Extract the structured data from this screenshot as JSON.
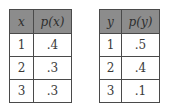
{
  "tables": [
    {
      "headers": [
        "x",
        "p(x)"
      ],
      "rows": [
        [
          "1",
          ".4"
        ],
        [
          "2",
          ".3"
        ],
        [
          "3",
          ".3"
        ]
      ]
    },
    {
      "headers": [
        "y",
        "p(y)"
      ],
      "rows": [
        [
          "1",
          ".5"
        ],
        [
          "2",
          ".4"
        ],
        [
          "3",
          ".1"
        ]
      ]
    }
  ],
  "colors": {
    "header_bg": "#8c8c8c",
    "border": "#4a4a4a",
    "text": "#3a3a3a"
  }
}
